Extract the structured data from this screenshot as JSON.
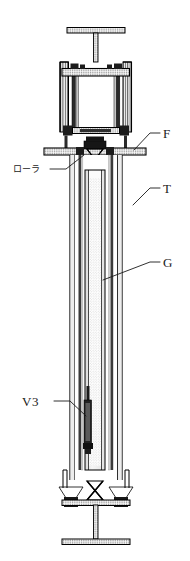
{
  "figure": {
    "background_color": "#ffffff",
    "line_color": "#000000",
    "label_color": "#1a1a1a",
    "width": 190,
    "height": 561
  },
  "labels": [
    {
      "id": "label-f",
      "text": "F",
      "kind": "latin",
      "x": 163,
      "y": 134,
      "leader_points": "134,150 150,133 160,133",
      "refers_to": "upper-flange"
    },
    {
      "id": "label-t",
      "text": "T",
      "kind": "latin",
      "x": 163,
      "y": 189,
      "leader_points": "133,205 150,188 160,188",
      "refers_to": "outer-tube"
    },
    {
      "id": "label-g",
      "text": "G",
      "kind": "latin",
      "x": 163,
      "y": 263,
      "leader_points": "105,280 150,262 160,262",
      "refers_to": "inner-column"
    },
    {
      "id": "label-v3",
      "text": "V3",
      "kind": "latin",
      "x": 23,
      "y": 405,
      "leader_points": "52,401 68,401 86,414",
      "refers_to": "valve-v3"
    },
    {
      "id": "label-roller",
      "text": "ローラ",
      "kind": "jp",
      "x": 14,
      "y": 172,
      "leader_points": "48,168 66,168 82,154",
      "refers_to": "roller-assembly"
    }
  ],
  "components": [
    {
      "id": "top-handle",
      "name": "T-shaped top handle bar",
      "hatched": true
    },
    {
      "id": "top-stem",
      "name": "Top vertical stem",
      "hatched": true
    },
    {
      "id": "top-cap-plate",
      "name": "Top cap plate",
      "hatched": true
    },
    {
      "id": "frame-left-rail",
      "name": "Left frame rail",
      "hatched": true
    },
    {
      "id": "frame-right-rail",
      "name": "Right frame rail",
      "hatched": true
    },
    {
      "id": "upper-flange",
      "name": "Upper flange F",
      "hatched": true
    },
    {
      "id": "roller-assembly",
      "name": "Roller assembly",
      "hatched": true
    },
    {
      "id": "outer-tube",
      "name": "Outer tube T",
      "hatched": false
    },
    {
      "id": "inner-column",
      "name": "Inner column G",
      "stippled": true
    },
    {
      "id": "valve-v3",
      "name": "Valve V3",
      "filled": true
    },
    {
      "id": "bottom-valves",
      "name": "Bottom valve pair",
      "filled": true
    },
    {
      "id": "bottom-stem",
      "name": "Bottom vertical stem",
      "hatched": true
    },
    {
      "id": "bottom-base",
      "name": "T-shaped bottom base bar",
      "hatched": true
    }
  ]
}
